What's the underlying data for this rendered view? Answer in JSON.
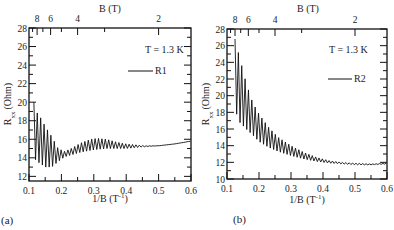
{
  "figure": {
    "panel_labels": [
      "(a)",
      "(b)"
    ]
  },
  "chart_data": [
    {
      "type": "line",
      "panel": "(a)",
      "title": "",
      "xlabel": "1/B (T⁻¹)",
      "ylabel": "R_xx (Ohm)",
      "top_axis_label": "B (T)",
      "top_axis_ticks": [
        "8",
        "6",
        "4",
        "2"
      ],
      "top_axis_tick_values_T": [
        8,
        6,
        4,
        2
      ],
      "xlim": [
        0.1,
        0.6
      ],
      "ylim": [
        11.5,
        28
      ],
      "xticks": [
        "0.1",
        "0.2",
        "0.3",
        "0.4",
        "0.5",
        "0.6"
      ],
      "yticks": [
        "12",
        "14",
        "16",
        "18",
        "20",
        "22",
        "24",
        "26",
        "28"
      ],
      "annotation": "T = 1.3 K",
      "legend": [
        {
          "name": "R1",
          "position": "upper right"
        }
      ],
      "grid": false,
      "series": [
        {
          "name": "R1",
          "envelope": {
            "x": [
              0.115,
              0.12,
              0.13,
              0.15,
              0.17,
              0.19,
              0.21,
              0.23,
              0.26,
              0.29,
              0.31,
              0.34,
              0.37,
              0.4,
              0.43,
              0.46,
              0.5,
              0.55,
              0.6
            ],
            "upper": [
              20.0,
              19.0,
              18.7,
              17.4,
              16.3,
              15.0,
              14.7,
              15.0,
              15.6,
              16.0,
              16.1,
              16.0,
              15.7,
              15.5,
              15.4,
              15.3,
              15.3,
              15.5,
              15.8
            ],
            "lower": [
              14.0,
              13.8,
              13.5,
              13.0,
              13.0,
              13.6,
              14.1,
              14.3,
              14.6,
              14.8,
              14.9,
              15.0,
              15.0,
              15.0,
              15.1,
              15.2,
              15.3,
              15.5,
              15.8
            ]
          },
          "oscillation_period_1_over_B": 0.0105
        }
      ]
    },
    {
      "type": "line",
      "panel": "(b)",
      "title": "",
      "xlabel": "1/B (T⁻¹)",
      "ylabel": "R_xx (Ohm)",
      "top_axis_label": "B (T)",
      "top_axis_ticks": [
        "8",
        "6",
        "4",
        "2"
      ],
      "top_axis_tick_values_T": [
        8,
        6,
        4,
        2
      ],
      "xlim": [
        0.1,
        0.6
      ],
      "ylim": [
        10,
        28
      ],
      "xticks": [
        "0.1",
        "0.2",
        "0.3",
        "0.4",
        "0.5",
        "0.6"
      ],
      "yticks": [
        "10",
        "12",
        "14",
        "16",
        "18",
        "20",
        "22",
        "24",
        "26",
        "28"
      ],
      "annotation": "T = 1.3 K",
      "legend": [
        {
          "name": "R2",
          "position": "upper right"
        }
      ],
      "grid": false,
      "series": [
        {
          "name": "R2",
          "envelope": {
            "x": [
              0.125,
              0.13,
              0.14,
              0.16,
              0.18,
              0.2,
              0.23,
              0.26,
              0.3,
              0.34,
              0.38,
              0.42,
              0.46,
              0.5,
              0.55,
              0.6
            ],
            "upper": [
              26.8,
              26.0,
              24.5,
              21.5,
              19.2,
              17.8,
              16.2,
              15.0,
              14.0,
              13.2,
              12.6,
              12.2,
              12.0,
              11.9,
              11.8,
              11.9
            ],
            "lower": [
              18.3,
              17.8,
              16.8,
              16.0,
              15.3,
              14.5,
              13.8,
              13.3,
              12.8,
              12.4,
              12.1,
              11.9,
              11.8,
              11.7,
              11.7,
              11.8
            ]
          },
          "oscillation_period_1_over_B": 0.0105
        }
      ]
    }
  ]
}
